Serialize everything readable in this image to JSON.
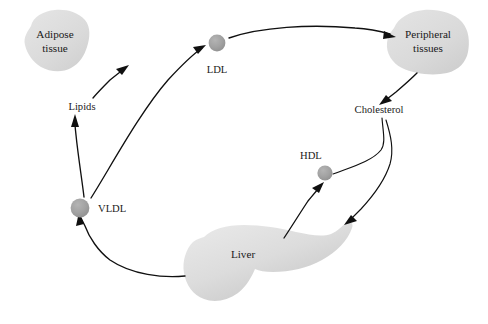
{
  "diagram": {
    "type": "flow-diagram",
    "background_color": "#ffffff",
    "organ_fill_light": "#e2e2e2",
    "organ_fill_mid": "#d5d5d5",
    "particle_fill": "#9e9e9e",
    "line_color": "#101010",
    "organs": [
      {
        "id": "adipose-tissue",
        "label_line1": "Adipose",
        "label_line2": "tissue",
        "center": {
          "x": 55,
          "y": 40
        }
      },
      {
        "id": "peripheral-tissues",
        "label_line1": "Peripheral",
        "label_line2": "tissues",
        "center": {
          "x": 428,
          "y": 40
        }
      },
      {
        "id": "liver",
        "label_line1": "Liver",
        "label_line2": "",
        "center": {
          "x": 243,
          "y": 254
        }
      }
    ],
    "particles": [
      {
        "id": "ldl",
        "label": "LDL",
        "center": {
          "x": 217,
          "y": 43
        },
        "radius": 8.4,
        "label_pos": {
          "x": 217,
          "y": 70
        }
      },
      {
        "id": "vldl",
        "label": "VLDL",
        "center": {
          "x": 80,
          "y": 208
        },
        "radius": 9.4,
        "label_pos": {
          "x": 117,
          "y": 212
        }
      },
      {
        "id": "hdl",
        "label": "HDL",
        "center": {
          "x": 325,
          "y": 173
        },
        "radius": 7.6,
        "label_pos": {
          "x": 312,
          "y": 158
        }
      }
    ],
    "edge_labels": [
      {
        "id": "lipids",
        "label": "Lipids",
        "pos": {
          "x": 82,
          "y": 107
        }
      },
      {
        "id": "cholesterol",
        "label": "Cholesterol",
        "pos": {
          "x": 379,
          "y": 110
        }
      }
    ],
    "flows": [
      {
        "id": "vldl-to-ldl",
        "from": "vldl",
        "to": "ldl"
      },
      {
        "id": "vldl-to-lipids",
        "from": "vldl",
        "to": "lipids"
      },
      {
        "id": "lipids-to-adipose",
        "from": "lipids",
        "to": "adipose-tissue"
      },
      {
        "id": "ldl-to-peripheral",
        "from": "ldl",
        "to": "peripheral-tissues"
      },
      {
        "id": "peripheral-to-cholesterol",
        "from": "peripheral-tissues",
        "to": "cholesterol"
      },
      {
        "id": "cholesterol-to-hdl",
        "from": "cholesterol",
        "to": "hdl"
      },
      {
        "id": "cholesterol-to-liver",
        "from": "cholesterol",
        "to": "liver"
      },
      {
        "id": "liver-to-hdl",
        "from": "liver",
        "to": "hdl"
      },
      {
        "id": "liver-to-vldl",
        "from": "liver",
        "to": "vldl"
      }
    ]
  }
}
